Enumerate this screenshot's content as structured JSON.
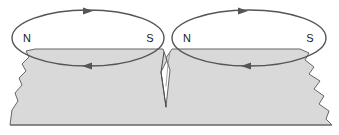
{
  "figure": {
    "name": "magnetic-domains-diagram",
    "width": 339,
    "height": 135,
    "background_color": "#ffffff"
  },
  "colors": {
    "stroke": "#555555",
    "material_fill": "#d9d9d9",
    "material_stroke": "#666666",
    "label_color": "#1a1a1a",
    "background": "#ffffff"
  },
  "domains": [
    {
      "id": "left-domain",
      "north_label": "N",
      "south_label": "S",
      "north_x": 27,
      "north_y": 42,
      "south_x": 150,
      "south_y": 42,
      "ellipse_cx": 88,
      "ellipse_cy": 38,
      "ellipse_rx": 76,
      "ellipse_ry": 28,
      "circulation": "clockwise",
      "top_arrow_x": 90,
      "top_arrow_y": 11,
      "top_arrow_direction": "right",
      "bottom_arrow_x": 86,
      "bottom_arrow_y": 66,
      "bottom_arrow_direction": "left"
    },
    {
      "id": "right-domain",
      "north_label": "N",
      "south_label": "S",
      "north_x": 187,
      "north_y": 42,
      "south_x": 310,
      "south_y": 42,
      "ellipse_cx": 249,
      "ellipse_cy": 38,
      "ellipse_rx": 77,
      "ellipse_ry": 28,
      "circulation": "clockwise",
      "top_arrow_x": 245,
      "top_arrow_y": 11,
      "top_arrow_direction": "right",
      "bottom_arrow_x": 245,
      "bottom_arrow_y": 66,
      "bottom_arrow_direction": "left"
    }
  ],
  "material_block": {
    "name": "magnetic-material-block",
    "top_surface_y": 49,
    "bottom_y": 125,
    "left_x": 10,
    "right_x": 332,
    "fill": "#d9d9d9",
    "edge_style": "torn-jagged",
    "crack": {
      "name": "center-crack",
      "apex_y": 107,
      "mouth_x": 166,
      "description": "narrow V-shaped fissure separating the two domains"
    }
  }
}
